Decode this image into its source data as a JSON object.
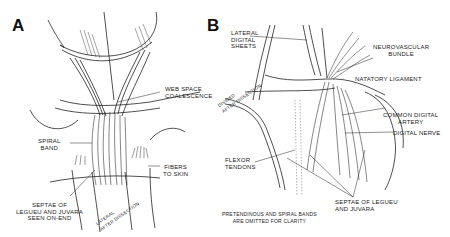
{
  "figure": {
    "panels": [
      {
        "id": "A",
        "letter": "A",
        "labels": {
          "web_space": "WEB SPACE\nCOALESCENCE",
          "spiral_band": "SPIRAL\nBAND",
          "fibers_to_skin": "FIBERS\nTO SKIN",
          "septae": "SEPTAE OF\nLEGUEU AND JUVARA\nSEEN ON-END",
          "rotated_note": "LATERAL\nAFTER DISSECTION"
        }
      },
      {
        "id": "B",
        "letter": "B",
        "labels": {
          "lateral_digital_sheets": "LATERAL\nDIGITAL\nSHEETS",
          "neurovascular_bundle": "NEUROVASCULAR\nBUNDLE",
          "natatory_ligament": "NATATORY LIGAMENT",
          "common_digital_artery": "COMMON DIGITAL\nARTERY",
          "digital_nerve": "DIGITAL NERVE",
          "flexor_tendons": "FLEXOR\nTENDONS",
          "septae": "SEPTAE OF LEGUEU\nAND JUVARA",
          "rotated_note": "DIVIDED\nAFTER DISSECTION",
          "caption": "PRETENDINOUS AND SPIRAL BANDS\nARE OMITTED FOR CLARITY"
        }
      }
    ]
  },
  "colors": {
    "ink": "#1a1a1a",
    "background": "#ffffff"
  }
}
